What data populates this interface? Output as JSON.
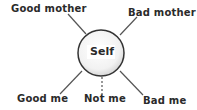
{
  "diagram": {
    "center": {
      "label": "Self"
    },
    "nodes": [
      {
        "id": "good-mother",
        "label": "Good mother",
        "line": "solid"
      },
      {
        "id": "bad-mother",
        "label": "Bad mother",
        "line": "solid"
      },
      {
        "id": "good-me",
        "label": "Good me",
        "line": "solid"
      },
      {
        "id": "not-me",
        "label": "Not me",
        "line": "dashed"
      },
      {
        "id": "bad-me",
        "label": "Bad me",
        "line": "solid"
      }
    ]
  }
}
